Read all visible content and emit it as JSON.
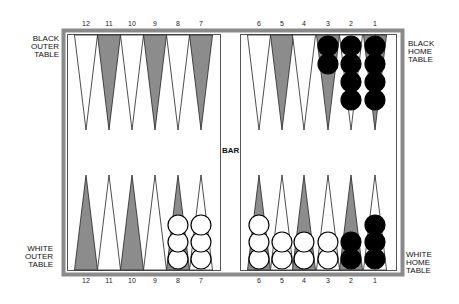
{
  "board": {
    "frame_color": "#8a8a8a",
    "dark_point_color": "#8c8c8c",
    "light_point_color": "#ffffff",
    "black_checker_color": "#000000",
    "white_checker_color": "#ffffff"
  },
  "labels": {
    "black_outer": [
      "BLACK",
      "OUTER",
      "TABLE"
    ],
    "black_home": [
      "BLACK",
      "HOME",
      "TABLE"
    ],
    "white_outer": [
      "WHITE",
      "OUTER",
      "TABLE"
    ],
    "white_home": [
      "WHITE",
      "HOME",
      "TABLE"
    ],
    "bar": "BAR"
  },
  "top_numbers": [
    "12",
    "11",
    "10",
    "9",
    "8",
    "7",
    "6",
    "5",
    "4",
    "3",
    "2",
    "1"
  ],
  "bottom_numbers": [
    "12",
    "11",
    "10",
    "9",
    "8",
    "7",
    "6",
    "5",
    "4",
    "3",
    "2",
    "1"
  ],
  "top_points": [
    {
      "number": "12",
      "shade": "light",
      "checkers": 0,
      "color": ""
    },
    {
      "number": "11",
      "shade": "dark",
      "checkers": 0,
      "color": ""
    },
    {
      "number": "10",
      "shade": "light",
      "checkers": 0,
      "color": ""
    },
    {
      "number": "9",
      "shade": "dark",
      "checkers": 0,
      "color": ""
    },
    {
      "number": "8",
      "shade": "light",
      "checkers": 0,
      "color": ""
    },
    {
      "number": "7",
      "shade": "dark",
      "checkers": 0,
      "color": ""
    },
    {
      "number": "6",
      "shade": "light",
      "checkers": 0,
      "color": ""
    },
    {
      "number": "5",
      "shade": "dark",
      "checkers": 0,
      "color": ""
    },
    {
      "number": "4",
      "shade": "light",
      "checkers": 0,
      "color": ""
    },
    {
      "number": "3",
      "shade": "dark",
      "checkers": 2,
      "color": "black"
    },
    {
      "number": "2",
      "shade": "light",
      "checkers": 4,
      "color": "black"
    },
    {
      "number": "1",
      "shade": "dark",
      "checkers": 4,
      "color": "black"
    }
  ],
  "bottom_points": [
    {
      "number": "12",
      "shade": "dark",
      "checkers": 0,
      "color": ""
    },
    {
      "number": "11",
      "shade": "light",
      "checkers": 0,
      "color": ""
    },
    {
      "number": "10",
      "shade": "dark",
      "checkers": 0,
      "color": ""
    },
    {
      "number": "9",
      "shade": "light",
      "checkers": 0,
      "color": ""
    },
    {
      "number": "8",
      "shade": "dark",
      "checkers": 3,
      "color": "white"
    },
    {
      "number": "7",
      "shade": "light",
      "checkers": 3,
      "color": "white"
    },
    {
      "number": "6",
      "shade": "dark",
      "checkers": 3,
      "color": "white"
    },
    {
      "number": "5",
      "shade": "light",
      "checkers": 2,
      "color": "white"
    },
    {
      "number": "4",
      "shade": "dark",
      "checkers": 2,
      "color": "white"
    },
    {
      "number": "3",
      "shade": "light",
      "checkers": 2,
      "color": "white"
    },
    {
      "number": "2",
      "shade": "dark",
      "checkers": 2,
      "color": "black"
    },
    {
      "number": "1",
      "shade": "light",
      "checkers": 3,
      "color": "black"
    }
  ]
}
